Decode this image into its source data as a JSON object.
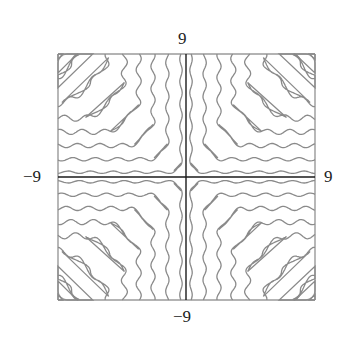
{
  "chart_data": {
    "type": "contour",
    "title": "",
    "xlabel": "",
    "ylabel": "",
    "xlim": [
      -9,
      9
    ],
    "ylim": [
      -9,
      9
    ],
    "tick_labels": {
      "top": "9",
      "bottom": "−9",
      "left": "−9",
      "right": "9"
    },
    "grid": false,
    "legend": null,
    "contour_offsets": [
      0.35,
      1.3,
      2.3,
      3.3,
      4.3,
      5.4,
      6.5,
      7.6,
      8.6
    ],
    "line_color": "#8a8a8a",
    "axis_color": "#1a1a1a",
    "frame_color": "#9a9a9a"
  }
}
